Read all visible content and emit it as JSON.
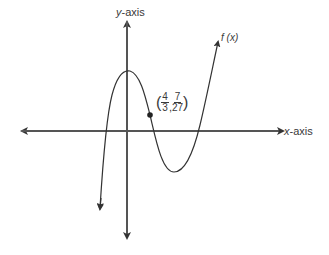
{
  "diagram": {
    "type": "function-graph",
    "y_axis_label_var": "y",
    "y_axis_label_rest": "-axis",
    "x_axis_label_var": "x",
    "x_axis_label_rest": "-axis",
    "function_label_f": "f",
    "function_label_arg": " (x)",
    "point": {
      "x_num": "4",
      "x_den": "3",
      "y_num": "7",
      "y_den": "27",
      "open": "(",
      "comma": ",",
      "close": ")"
    },
    "colors": {
      "axis": "#4a4a4a",
      "curve": "#3a3a3a",
      "text": "#3a3a3a"
    }
  }
}
